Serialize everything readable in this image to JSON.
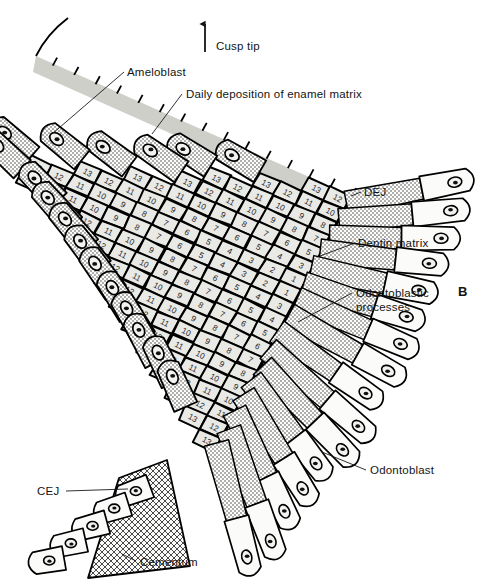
{
  "figure": {
    "panel_label": "B",
    "title_alt": "Daily deposition of enamel and dentin matrix at a cusp"
  },
  "orientation": {
    "arrow_label": "Cusp tip",
    "arrow_icon": "up-arrow-icon"
  },
  "labels": {
    "ameloblast": "Ameloblast",
    "daily_deposition": "Daily deposition of enamel matrix",
    "dej": "DEJ",
    "dentin_matrix": "Dentin matrix",
    "odontoblastic_processes_line1": "Odontoblastic",
    "odontoblastic_processes_line2": "processes",
    "odontoblast": "Odontoblast",
    "cej": "CEJ",
    "cementum": "Cementum"
  },
  "enamel_grid": {
    "description": "Incremental enamel matrix increments numbered by day, counting down from the dentinoenamel junction outward",
    "max_increment": 13,
    "min_increment": 1,
    "row_sequences": [
      [
        13,
        12
      ],
      [
        13,
        12,
        11,
        10
      ],
      [
        13,
        12,
        11,
        10,
        9,
        8
      ],
      [
        13,
        12,
        11,
        10,
        9,
        8,
        7
      ],
      [
        13,
        12,
        11,
        10,
        9,
        8,
        7,
        6,
        5
      ],
      [
        13,
        12,
        11,
        10,
        9,
        8,
        7,
        6,
        5,
        4,
        3
      ],
      [
        13,
        12,
        11,
        10,
        9,
        8,
        7,
        6,
        5,
        4,
        3,
        2,
        1
      ],
      [
        13,
        12,
        11,
        10,
        9,
        8,
        7,
        6,
        5,
        4,
        3,
        2,
        1
      ],
      [
        13,
        12,
        11,
        10,
        9,
        8,
        7,
        6,
        5,
        4,
        3
      ],
      [
        13,
        12,
        11,
        10,
        9,
        8,
        7,
        6,
        5,
        4
      ],
      [
        13,
        12,
        11,
        10,
        9,
        8,
        7,
        6,
        5
      ],
      [
        13,
        12,
        11,
        10,
        9,
        8,
        7,
        6
      ],
      [
        13,
        12,
        11,
        10,
        9,
        8,
        7
      ],
      [
        13,
        12,
        11,
        10,
        9,
        8
      ],
      [
        13,
        12,
        11,
        10,
        9
      ],
      [
        13,
        12,
        11,
        10
      ],
      [
        13,
        12,
        11
      ],
      [
        13,
        12
      ],
      [
        13
      ]
    ]
  },
  "counts": {
    "ameloblast_cells": 17,
    "odontoblast_cells": 16
  },
  "colors": {
    "background": "#ffffff",
    "ink": "#000000",
    "enamel_cell_fill": "#e9e9e6",
    "enamel_surface_band": "#cfcfc9",
    "stipple_ink": "#303030",
    "text": "#141414"
  }
}
